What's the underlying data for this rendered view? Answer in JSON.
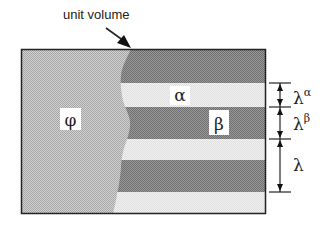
{
  "diagram": {
    "title_label": "unit volume",
    "phases": {
      "phi": {
        "label": "φ",
        "color": "#bdbdbd"
      },
      "alpha": {
        "label": "α",
        "color": "#ececec"
      },
      "beta": {
        "label": "β",
        "color": "#8c8c8c"
      }
    },
    "dimensions": [
      {
        "symbol": "λ",
        "superscript": "α"
      },
      {
        "symbol": "λ",
        "superscript": "β"
      },
      {
        "symbol": "λ",
        "superscript": ""
      }
    ],
    "colors": {
      "border": "#222222",
      "dark_band": "#8c8c8c",
      "light_band": "#ececec",
      "phi_region": "#bdbdbd"
    }
  }
}
